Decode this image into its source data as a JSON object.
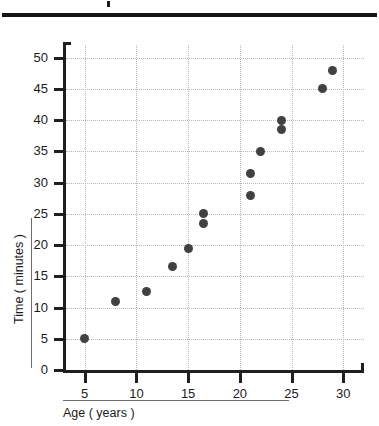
{
  "chart_data": {
    "type": "scatter",
    "title": "",
    "xlabel": "Age ( years )",
    "ylabel": "Time ( minutes )",
    "xlim": [
      3,
      32
    ],
    "ylim": [
      0,
      52
    ],
    "xticks": [
      5,
      10,
      15,
      20,
      25,
      30
    ],
    "yticks": [
      0,
      5,
      10,
      15,
      20,
      25,
      30,
      35,
      40,
      45,
      50
    ],
    "grid": true,
    "legend": "none",
    "points": [
      {
        "x": 5,
        "y": 5
      },
      {
        "x": 8,
        "y": 11
      },
      {
        "x": 11,
        "y": 12.5
      },
      {
        "x": 13.5,
        "y": 16.5
      },
      {
        "x": 15,
        "y": 19.5
      },
      {
        "x": 16.5,
        "y": 23.5
      },
      {
        "x": 16.5,
        "y": 25
      },
      {
        "x": 21,
        "y": 28
      },
      {
        "x": 21,
        "y": 31.5
      },
      {
        "x": 22,
        "y": 35
      },
      {
        "x": 24,
        "y": 38.5
      },
      {
        "x": 24,
        "y": 40
      },
      {
        "x": 28,
        "y": 45
      },
      {
        "x": 29,
        "y": 48
      }
    ],
    "point_color": "#414141",
    "grid_color": "#b9b9b9",
    "axis_color": "#1f1f1f"
  },
  "decorations": {
    "top_rule": "",
    "top_mark": ""
  }
}
